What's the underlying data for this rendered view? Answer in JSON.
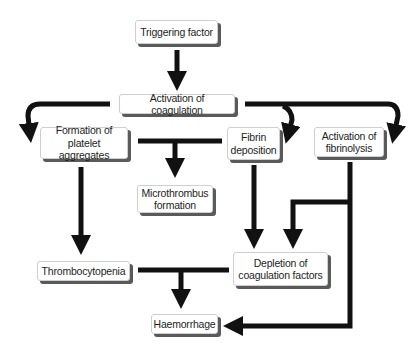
{
  "diagram": {
    "type": "flowchart",
    "colors": {
      "arrow": "#111111",
      "box_fill": "#ffffff",
      "box_border": "#cfcfcf",
      "box_shadow": "#5a5a5a",
      "text": "#1e1e1e"
    },
    "nodes": {
      "triggering_factor": "Triggering factor",
      "activation_coagulation": "Activation of coagulation",
      "platelet_aggregates": "Formation of\nplatelet aggregates",
      "fibrin_deposition": "Fibrin\ndeposition",
      "activation_fibrinolysis": "Activation of\nfibrinolysis",
      "microthrombus": "Microthrombus\nformation",
      "thrombocytopenia": "Thrombocytopenia",
      "depletion_factors": "Depletion of\ncoagulation factors",
      "haemorrhage": "Haemorrhage"
    },
    "edges": [
      {
        "from": "Triggering factor",
        "to": "Activation of coagulation"
      },
      {
        "from": "Activation of coagulation",
        "to": "Formation of platelet aggregates"
      },
      {
        "from": "Activation of coagulation",
        "to": "Fibrin deposition"
      },
      {
        "from": "Activation of coagulation",
        "to": "Activation of fibrinolysis"
      },
      {
        "from": [
          "Formation of platelet aggregates",
          "Fibrin deposition"
        ],
        "to": "Microthrombus formation"
      },
      {
        "from": "Formation of platelet aggregates",
        "to": "Thrombocytopenia"
      },
      {
        "from": "Fibrin deposition",
        "to": "Depletion of coagulation factors"
      },
      {
        "from": "Activation of fibrinolysis",
        "to": "Depletion of coagulation factors"
      },
      {
        "from": [
          "Thrombocytopenia",
          "Depletion of coagulation factors"
        ],
        "to": "Haemorrhage"
      },
      {
        "from": "Activation of fibrinolysis",
        "to": "Haemorrhage"
      }
    ]
  }
}
